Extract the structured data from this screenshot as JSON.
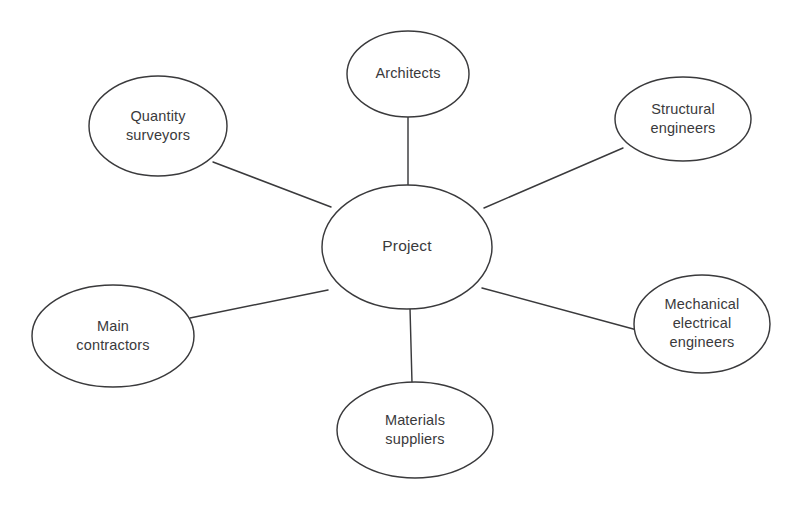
{
  "diagram": {
    "type": "hub-and-spoke",
    "background_color": "#ffffff",
    "stroke_color": "#3a3a3c",
    "text_color": "#3a3a3c",
    "center": {
      "id": "project",
      "label": "Project",
      "lines": [
        "Project"
      ],
      "cx": 407,
      "cy": 247,
      "rx": 85,
      "ry": 62
    },
    "nodes": [
      {
        "id": "architects",
        "label": "Architects",
        "lines": [
          "Architects"
        ],
        "cx": 408,
        "cy": 74,
        "rx": 61,
        "ry": 43
      },
      {
        "id": "quantity-surveyors",
        "label": "Quantity surveyors",
        "lines": [
          "Quantity",
          "surveyors"
        ],
        "cx": 158,
        "cy": 126,
        "rx": 69,
        "ry": 50
      },
      {
        "id": "structural-engineers",
        "label": "Structural engineers",
        "lines": [
          "Structural",
          "engineers"
        ],
        "cx": 683,
        "cy": 119,
        "rx": 68,
        "ry": 42
      },
      {
        "id": "mechanical-electrical-engineers",
        "label": "Mechanical electrical engineers",
        "lines": [
          "Mechanical",
          "electrical",
          "engineers"
        ],
        "cx": 702,
        "cy": 324,
        "rx": 68,
        "ry": 49
      },
      {
        "id": "materials-suppliers",
        "label": "Materials suppliers",
        "lines": [
          "Materials",
          "suppliers"
        ],
        "cx": 415,
        "cy": 430,
        "rx": 78,
        "ry": 48
      },
      {
        "id": "main-contractors",
        "label": "Main contractors",
        "lines": [
          "Main",
          "contractors"
        ],
        "cx": 113,
        "cy": 336,
        "rx": 81,
        "ry": 51
      }
    ],
    "edges": [
      {
        "id": "edge-project-architects",
        "from": "project",
        "to": "architects",
        "x1": 408,
        "y1": 185,
        "x2": 408,
        "y2": 117
      },
      {
        "id": "edge-project-quantity-surveyors",
        "from": "project",
        "to": "quantity-surveyors",
        "x1": 331,
        "y1": 207,
        "x2": 213,
        "y2": 162
      },
      {
        "id": "edge-project-structural-engineers",
        "from": "project",
        "to": "structural-engineers",
        "x1": 484,
        "y1": 208,
        "x2": 623,
        "y2": 148
      },
      {
        "id": "edge-project-mechanical-electrical-engineers",
        "from": "project",
        "to": "mechanical-electrical-engineers",
        "x1": 482,
        "y1": 288,
        "x2": 637,
        "y2": 330
      },
      {
        "id": "edge-project-materials-suppliers",
        "from": "project",
        "to": "materials-suppliers",
        "x1": 410,
        "y1": 308,
        "x2": 412,
        "y2": 383
      },
      {
        "id": "edge-project-main-contractors",
        "from": "project",
        "to": "main-contractors",
        "x1": 328,
        "y1": 290,
        "x2": 190,
        "y2": 318
      }
    ]
  }
}
